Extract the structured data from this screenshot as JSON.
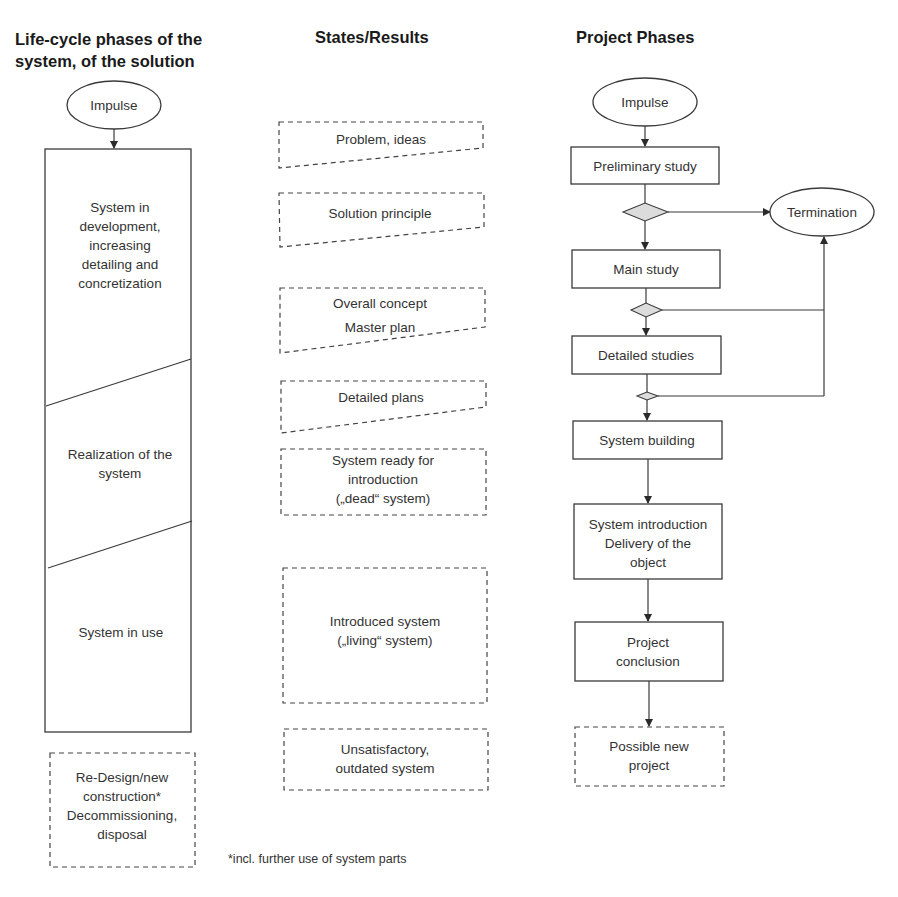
{
  "headers": {
    "lifecycle_line1": "Life-cycle phases of the",
    "lifecycle_line2": "system, of the solution",
    "states": "States/Results",
    "project": "Project Phases"
  },
  "lifecycle": {
    "impulse": "Impulse",
    "phases": [
      {
        "lines": [
          "System in",
          "development,",
          "increasing",
          "detailing and",
          "concretization"
        ]
      },
      {
        "lines": [
          "Realization of the",
          "system"
        ]
      },
      {
        "lines": [
          "System in use"
        ]
      }
    ],
    "after": {
      "lines": [
        "Re-Design/new",
        "construction*",
        "Decommissioning,",
        "disposal"
      ]
    }
  },
  "states": [
    {
      "lines": [
        "Problem, ideas"
      ]
    },
    {
      "lines": [
        "Solution principle"
      ]
    },
    {
      "lines": [
        "Overall concept",
        "Master plan"
      ]
    },
    {
      "lines": [
        "Detailed plans"
      ]
    },
    {
      "lines": [
        "System ready for",
        "introduction",
        "(„dead“ system)"
      ]
    },
    {
      "lines": [
        "Introduced system",
        "(„living“ system)"
      ]
    },
    {
      "lines": [
        "Unsatisfactory,",
        "outdated system"
      ]
    }
  ],
  "project": {
    "impulse": "Impulse",
    "termination": "Termination",
    "steps": [
      {
        "lines": [
          "Preliminary study"
        ]
      },
      {
        "lines": [
          "Main study"
        ]
      },
      {
        "lines": [
          "Detailed studies"
        ]
      },
      {
        "lines": [
          "System building"
        ]
      },
      {
        "lines": [
          "System introduction",
          "Delivery of the",
          "object"
        ]
      },
      {
        "lines": [
          "Project",
          "conclusion"
        ]
      }
    ],
    "next": {
      "lines": [
        "Possible new",
        "project"
      ]
    }
  },
  "footnote": "*incl. further use of system parts"
}
